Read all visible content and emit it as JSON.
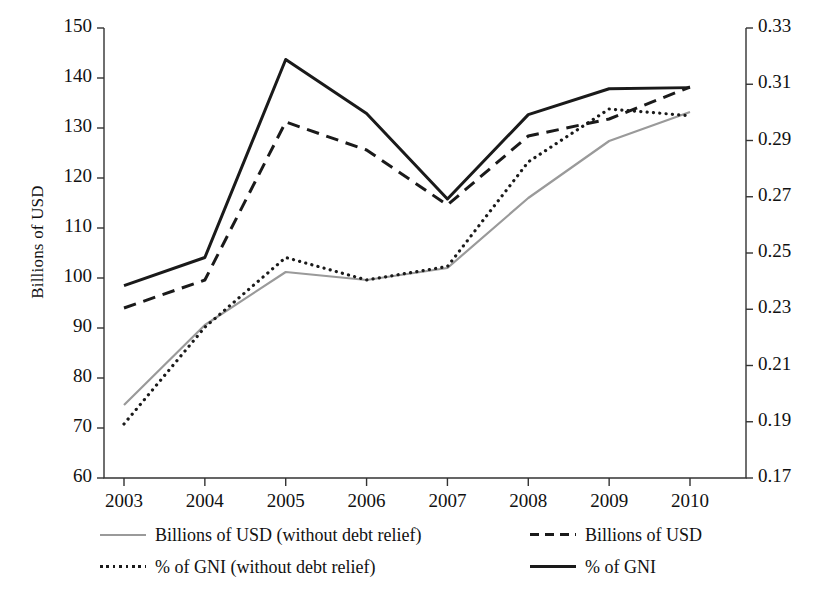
{
  "chart_data": {
    "type": "line",
    "title": "",
    "xlabel": "",
    "ylabel": "Billions of USD",
    "y2label": "ODA as per cent of GNI",
    "x": [
      2003,
      2004,
      2005,
      2006,
      2007,
      2008,
      2009,
      2010
    ],
    "xtick_labels": [
      "2003",
      "2004",
      "2005",
      "2006",
      "2007",
      "2008",
      "2009",
      "2010"
    ],
    "ylim": [
      60,
      150
    ],
    "ytick_values": [
      60,
      70,
      80,
      90,
      100,
      110,
      120,
      130,
      140,
      150
    ],
    "ytick_labels": [
      "60",
      "70",
      "80",
      "90",
      "100",
      "110",
      "120",
      "130",
      "140",
      "150"
    ],
    "y2lim": [
      0.17,
      0.33
    ],
    "y2tick_values": [
      0.17,
      0.19,
      0.21,
      0.23,
      0.25,
      0.27,
      0.29,
      0.31,
      0.33
    ],
    "y2tick_labels": [
      "0.17",
      "0.19",
      "0.21",
      "0.23",
      "0.25",
      "0.27",
      "0.29",
      "0.31",
      "0.33"
    ],
    "grid": false,
    "legend_position": "bottom",
    "series": [
      {
        "name": "Billions of USD (without debt relief)",
        "axis": "left",
        "style": "solid",
        "color": "#9a9a9a",
        "width": 2.2,
        "values": [
          74.6,
          90.6,
          101.2,
          99.6,
          102.0,
          116.0,
          127.4,
          133.2
        ]
      },
      {
        "name": "Billions of USD",
        "axis": "left",
        "style": "dashed",
        "color": "#1a1a1a",
        "width": 3.0,
        "values": [
          94.0,
          99.6,
          131.2,
          125.6,
          114.6,
          128.4,
          131.8,
          138.2
        ]
      },
      {
        "name": "% of GNI (without debt relief)",
        "axis": "right",
        "style": "dotted",
        "color": "#1a1a1a",
        "width": 3.2,
        "values": [
          0.1892,
          0.2236,
          0.2484,
          0.2404,
          0.2452,
          0.2824,
          0.3012,
          0.2988
        ]
      },
      {
        "name": "% of GNI",
        "axis": "right",
        "style": "solid",
        "color": "#1a1a1a",
        "width": 3.0,
        "values": [
          0.2384,
          0.2484,
          0.3188,
          0.2996,
          0.2692,
          0.2992,
          0.3084,
          0.3088
        ]
      }
    ]
  },
  "legend": {
    "entries": [
      {
        "label": "Billions of USD (without debt relief)",
        "style": "solid",
        "color": "#9a9a9a"
      },
      {
        "label": "Billions of USD",
        "style": "dashed",
        "color": "#1a1a1a"
      },
      {
        "label": "% of GNI (without debt relief)",
        "style": "dotted",
        "color": "#1a1a1a"
      },
      {
        "label": "% of GNI",
        "style": "solid",
        "color": "#1a1a1a"
      }
    ]
  }
}
